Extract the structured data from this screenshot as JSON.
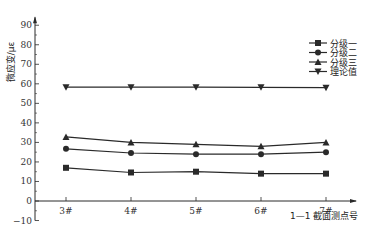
{
  "chart_data": {
    "type": "line",
    "title": "",
    "xlabel": "1—1 截面测点号",
    "ylabel": "微应变/με",
    "categories": [
      "3#",
      "4#",
      "5#",
      "6#",
      "7#"
    ],
    "ylim": [
      -10,
      90
    ],
    "yticks": [
      -10,
      0,
      10,
      20,
      30,
      40,
      50,
      60,
      70,
      80,
      90
    ],
    "grid": false,
    "legend_position": "upper right",
    "series": [
      {
        "name": "分级一",
        "marker": "square",
        "values": [
          17,
          14.6,
          15,
          14,
          14
        ]
      },
      {
        "name": "分级二",
        "marker": "circle",
        "values": [
          26.7,
          24.6,
          24,
          24,
          25
        ]
      },
      {
        "name": "分级三",
        "marker": "triangle-up",
        "values": [
          32.8,
          30,
          29,
          28,
          30
        ]
      },
      {
        "name": "理论值",
        "marker": "triangle-down",
        "values": [
          58.3,
          58.3,
          58.3,
          58.2,
          58
        ]
      }
    ]
  }
}
